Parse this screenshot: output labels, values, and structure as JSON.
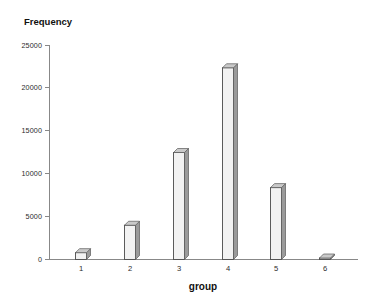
{
  "chart_data": {
    "type": "bar",
    "title": "",
    "xlabel": "group",
    "ylabel": "Frequency",
    "categories": [
      "1",
      "2",
      "3",
      "4",
      "5",
      "6"
    ],
    "values": [
      800,
      4000,
      12500,
      22400,
      8400,
      150
    ],
    "ylim": [
      0,
      25000
    ],
    "yticks": [
      0,
      5000,
      10000,
      15000,
      20000,
      25000
    ],
    "ytick_labels": [
      "0",
      "5000",
      "10000",
      "15000",
      "20000",
      "25000"
    ],
    "grid": false,
    "legend": null,
    "bar_fill_color": "#f2f2f2",
    "bar_edge_color": "#4a4a4a",
    "bar_shadow_color": "#9a9a9a",
    "axis_color": "#888888",
    "background_color": "#ffffff"
  },
  "axes": {
    "y_title": "Frequency",
    "x_title": "group"
  }
}
